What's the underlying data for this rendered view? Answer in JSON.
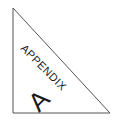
{
  "badge": {
    "word": "APPENDIX",
    "letter": "A",
    "stroke_color": "#555555",
    "text_color": "#1a1a1a"
  }
}
